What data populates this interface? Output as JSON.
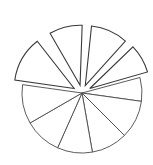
{
  "chart_data": {
    "type": "pie",
    "title": "",
    "subtitle": "",
    "xlabel": "",
    "ylabel": "",
    "grid": false,
    "legend_position": "none",
    "style": {
      "fill": "#ffffff",
      "stroke": "#4a4a4a",
      "emphasis_stroke": "#111111",
      "background": "#ffffff",
      "stroke_width": 0.9
    },
    "geometry": {
      "center_x": 82,
      "center_y": 93,
      "radius": 60,
      "start_angle_deg": -90,
      "direction": "clockwise"
    },
    "categories": [
      "Slice 1",
      "Slice 2",
      "Slice 3",
      "Slice 4",
      "Slice 5",
      "Slice 6",
      "Slice 7",
      "Slice 8",
      "Slice 9",
      "Slice 10"
    ],
    "values": [
      12,
      10,
      11,
      9,
      11,
      10,
      9,
      10,
      8,
      10
    ],
    "slices": [
      {
        "label": "Slice 1",
        "value": 12,
        "start_deg": 188,
        "end_deg": 232,
        "exploded": true,
        "explode_distance": 9,
        "emphasis": false
      },
      {
        "label": "Slice 2",
        "value": 10,
        "start_deg": 240,
        "end_deg": 272,
        "exploded": true,
        "explode_distance": 8,
        "emphasis": false
      },
      {
        "label": "Slice 3",
        "value": 11,
        "start_deg": 276,
        "end_deg": 312,
        "exploded": true,
        "explode_distance": 8,
        "emphasis": false
      },
      {
        "label": "Slice 4",
        "value": 9,
        "start_deg": 316,
        "end_deg": 344,
        "exploded": true,
        "explode_distance": 9,
        "emphasis": true
      },
      {
        "label": "Slice 5",
        "value": 11,
        "start_deg": 345,
        "end_deg": 8,
        "exploded": false,
        "explode_distance": 0,
        "emphasis": false
      },
      {
        "label": "Slice 6",
        "value": 10,
        "start_deg": 8,
        "end_deg": 45,
        "exploded": false,
        "explode_distance": 0,
        "emphasis": false
      },
      {
        "label": "Slice 7",
        "value": 9,
        "start_deg": 45,
        "end_deg": 80,
        "exploded": false,
        "explode_distance": 0,
        "emphasis": false
      },
      {
        "label": "Slice 8",
        "value": 10,
        "start_deg": 80,
        "end_deg": 114,
        "exploded": false,
        "explode_distance": 0,
        "emphasis": false
      },
      {
        "label": "Slice 9",
        "value": 8,
        "start_deg": 114,
        "end_deg": 150,
        "exploded": false,
        "explode_distance": 0,
        "emphasis": false
      },
      {
        "label": "Slice 10",
        "value": 10,
        "start_deg": 150,
        "end_deg": 188,
        "exploded": false,
        "explode_distance": 0,
        "emphasis": false
      }
    ]
  }
}
